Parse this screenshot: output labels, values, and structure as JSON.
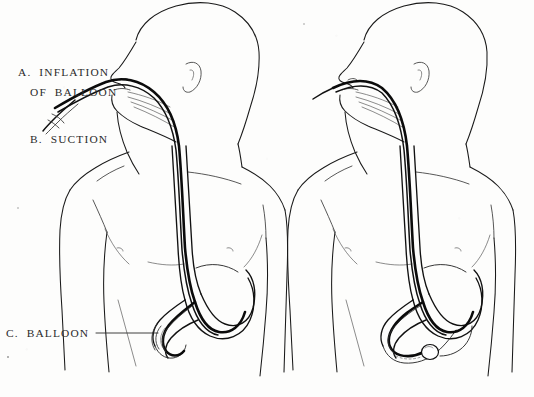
{
  "plate": {
    "title": "Nasogastric balloon tube placement",
    "background_color": "#fdfdfc",
    "ink_color": "#1a1a1a",
    "width": 534,
    "height": 397
  },
  "labels": {
    "a_line1": "A.  INFLATION",
    "a_line2": "OF  BALLOON",
    "b": "B.  SUCTION",
    "c": "C.  BALLOON"
  },
  "figures": [
    {
      "id": "left-figure",
      "name": "patient-left",
      "description": "Male torso, head in profile facing left, nasogastric tube inserted through nose, passing down esophagus into stomach, tip with deflated balloon curling at the pylorus",
      "tube_state": "deflated",
      "has_y_connector": true,
      "balloon_labeled": true
    },
    {
      "id": "right-figure",
      "name": "patient-right",
      "description": "Male torso, head in profile facing left, single tube advanced further so the inflated balloon sits in the duodenum beyond the pylorus",
      "tube_state": "inflated",
      "has_y_connector": false,
      "balloon_labeled": false
    }
  ],
  "annotations": {
    "a_target": "y-connector inflation limb at the nose",
    "b_target": "suction limb branching downward from the connector",
    "c_target": "deflated balloon at tube tip inside the stomach outlet"
  }
}
